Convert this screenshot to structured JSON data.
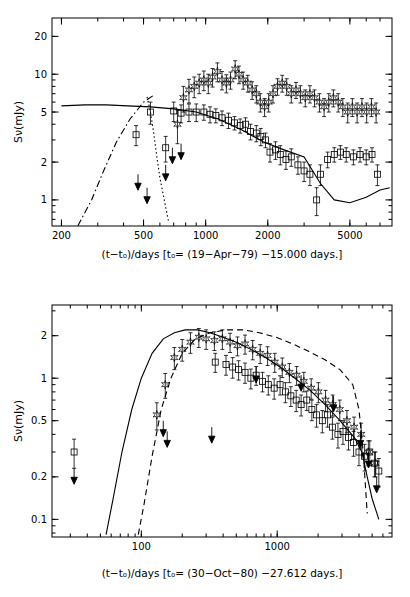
{
  "figure": {
    "title": "",
    "panels": [
      {
        "id": "top",
        "ylabel": "Sν(mJy)",
        "caption": "(t−t₀)/days [t₀= (19−Apr−79) −15.000 days.]",
        "x_ticklabels": [
          "200",
          "500",
          "1000",
          "2000",
          "5000"
        ],
        "x_tickvalues": [
          200,
          500,
          1000,
          2000,
          5000
        ],
        "y_ticklabels": [
          "1",
          "2",
          "5",
          "10",
          "20"
        ],
        "y_tickvalues": [
          1,
          2,
          5,
          10,
          20
        ],
        "xlim": [
          180,
          8000
        ],
        "ylim": [
          0.62,
          28
        ]
      },
      {
        "id": "bottom",
        "ylabel": "Sν(mJy)",
        "caption": "(t−t₀)/days [t₀= (30−Oct−80) −27.612 days.]",
        "x_ticklabels": [
          "100",
          "1000"
        ],
        "x_tickvalues": [
          100,
          1000
        ],
        "y_ticklabels": [
          "0.1",
          "0.2",
          "0.5",
          "1",
          "2"
        ],
        "y_tickvalues": [
          0.1,
          0.2,
          0.5,
          1,
          2
        ],
        "xlim": [
          22,
          7000
        ],
        "ylim": [
          0.075,
          3.3
        ]
      }
    ]
  },
  "chart_data": [
    {
      "type": "scatter",
      "title": "",
      "panel": "top",
      "xlabel": "(t-t0)/days [t0= (19-Apr-79) -15.000 days.]",
      "ylabel": "S_nu (mJy)",
      "xscale": "log",
      "yscale": "log",
      "xlim": [
        180,
        8000
      ],
      "ylim": [
        0.62,
        28
      ],
      "xticks": [
        200,
        500,
        1000,
        2000,
        5000
      ],
      "yticks": [
        1,
        2,
        5,
        10,
        20
      ],
      "grid": false,
      "legend": false,
      "series": [
        {
          "name": "squares (lower frequency flux)",
          "marker": "open-square",
          "x": [
            460,
            540,
            640,
            700,
            760,
            830,
            900,
            980,
            1050,
            1120,
            1200,
            1290,
            1380,
            1470,
            1560,
            1650,
            1760,
            1850,
            1950,
            2050,
            2180,
            2300,
            2450,
            2600,
            2800,
            3000,
            3200,
            3450,
            3600,
            3900,
            4200,
            4500,
            4800,
            5200,
            5600,
            6000,
            6400,
            6800
          ],
          "y": [
            3.3,
            5.0,
            2.6,
            5.1,
            4.9,
            5.0,
            5.0,
            5.0,
            4.8,
            4.7,
            4.5,
            4.3,
            4.1,
            3.9,
            4.0,
            3.5,
            3.4,
            3.2,
            3.0,
            2.4,
            2.5,
            2.3,
            2.1,
            2.2,
            1.9,
            1.7,
            1.6,
            1.0,
            1.6,
            2.1,
            2.3,
            2.4,
            2.3,
            2.2,
            2.3,
            2.2,
            2.3,
            1.6
          ],
          "yerr": [
            0.6,
            1.0,
            0.6,
            0.9,
            0.8,
            0.8,
            0.8,
            0.7,
            0.7,
            0.6,
            0.6,
            0.6,
            0.5,
            0.5,
            0.5,
            0.5,
            0.5,
            0.5,
            0.4,
            0.4,
            0.4,
            0.4,
            0.35,
            0.35,
            0.3,
            0.3,
            0.3,
            0.25,
            0.3,
            0.3,
            0.3,
            0.3,
            0.3,
            0.3,
            0.3,
            0.3,
            0.3,
            0.3
          ]
        },
        {
          "name": "stars (higher frequency flux)",
          "marker": "open-star",
          "x": [
            730,
            780,
            830,
            880,
            930,
            980,
            1030,
            1080,
            1140,
            1200,
            1260,
            1320,
            1390,
            1450,
            1520,
            1600,
            1680,
            1760,
            1840,
            1930,
            2020,
            2120,
            2230,
            2350,
            2470,
            2600,
            2740,
            2880,
            3040,
            3200,
            3370,
            3560,
            3750,
            3950,
            4160,
            4390,
            4620,
            4880,
            5140,
            5420,
            5720,
            6030,
            6360,
            6700
          ],
          "y": [
            4.0,
            6.5,
            7.5,
            8.0,
            8.5,
            9.0,
            8.5,
            9.5,
            10.5,
            9.0,
            8.5,
            9.0,
            11.0,
            10.0,
            9.0,
            8.5,
            7.5,
            7.0,
            6.0,
            5.5,
            6.0,
            7.0,
            8.0,
            8.5,
            8.0,
            7.0,
            7.5,
            7.0,
            6.5,
            7.0,
            6.5,
            6.0,
            5.5,
            6.0,
            6.5,
            6.0,
            5.5,
            5.0,
            5.5,
            5.0,
            5.5,
            5.0,
            5.5,
            5.0
          ],
          "yerr": [
            1.2,
            1.5,
            1.6,
            1.5,
            1.5,
            1.6,
            1.5,
            1.6,
            1.8,
            1.5,
            1.4,
            1.4,
            1.8,
            1.6,
            1.4,
            1.3,
            1.2,
            1.1,
            1.0,
            0.9,
            1.0,
            1.1,
            1.2,
            1.3,
            1.2,
            1.1,
            1.1,
            1.1,
            1.0,
            1.1,
            1.0,
            1.0,
            0.9,
            1.0,
            1.0,
            1.0,
            0.9,
            0.9,
            0.9,
            0.9,
            0.9,
            0.9,
            0.9,
            0.9
          ]
        },
        {
          "name": "upper limits (arrows)",
          "marker": "downward-arrow",
          "x": [
            470,
            520,
            640,
            690,
            760
          ],
          "y": [
            1.6,
            1.25,
            1.9,
            2.6,
            2.8
          ]
        }
      ],
      "model_curves": [
        {
          "name": "solid model",
          "style": "solid",
          "x": [
            200,
            260,
            330,
            420,
            540,
            700,
            900,
            1150,
            1500,
            1900,
            2400,
            3000,
            3600,
            4200,
            5000,
            6000,
            7000,
            7800
          ],
          "y": [
            5.6,
            5.7,
            5.7,
            5.6,
            5.5,
            5.3,
            5.0,
            4.4,
            3.6,
            2.9,
            2.5,
            2.2,
            1.35,
            1.0,
            0.95,
            1.05,
            1.2,
            1.25
          ]
        },
        {
          "name": "dash-dot model",
          "style": "dashdot",
          "x": [
            240,
            280,
            320,
            370,
            430,
            500,
            560
          ],
          "y": [
            0.62,
            1.0,
            1.7,
            2.9,
            4.4,
            6.0,
            6.8
          ]
        },
        {
          "name": "dotted model",
          "style": "dotted",
          "x": [
            520,
            540,
            560,
            580,
            600,
            630,
            660
          ],
          "y": [
            6.6,
            5.0,
            3.4,
            2.2,
            1.5,
            1.0,
            0.68
          ]
        }
      ]
    },
    {
      "type": "scatter",
      "title": "",
      "panel": "bottom",
      "xlabel": "(t-t0)/days [t0= (30-Oct-80) -27.612 days.]",
      "ylabel": "S_nu (mJy)",
      "xscale": "log",
      "yscale": "log",
      "xlim": [
        22,
        7000
      ],
      "ylim": [
        0.075,
        3.3
      ],
      "xticks": [
        100,
        1000
      ],
      "yticks": [
        0.1,
        0.2,
        0.5,
        1,
        2
      ],
      "grid": false,
      "legend": false,
      "series": [
        {
          "name": "squares (lower frequency flux)",
          "marker": "open-square",
          "x": [
            32,
            350,
            420,
            470,
            520,
            580,
            640,
            700,
            780,
            860,
            950,
            1050,
            1150,
            1260,
            1380,
            1500,
            1650,
            1800,
            1950,
            2150,
            2350,
            2550,
            2800,
            3050,
            3350,
            3650,
            4000,
            4400,
            4800,
            5200,
            5600
          ],
          "y": [
            0.3,
            1.3,
            1.25,
            1.2,
            1.15,
            1.1,
            1.0,
            1.05,
            0.95,
            0.9,
            0.85,
            0.9,
            0.8,
            0.75,
            0.7,
            0.65,
            0.7,
            0.6,
            0.55,
            0.5,
            0.55,
            0.45,
            0.4,
            0.42,
            0.38,
            0.35,
            0.3,
            0.28,
            0.3,
            0.25,
            0.22
          ],
          "yerr": [
            0.07,
            0.2,
            0.2,
            0.2,
            0.18,
            0.18,
            0.16,
            0.16,
            0.15,
            0.14,
            0.14,
            0.14,
            0.13,
            0.12,
            0.12,
            0.11,
            0.11,
            0.1,
            0.1,
            0.09,
            0.1,
            0.08,
            0.08,
            0.08,
            0.07,
            0.07,
            0.06,
            0.06,
            0.06,
            0.05,
            0.05
          ]
        },
        {
          "name": "stars (higher frequency flux)",
          "marker": "open-star",
          "x": [
            130,
            150,
            175,
            200,
            230,
            265,
            300,
            345,
            395,
            450,
            510,
            580,
            660,
            750,
            850,
            960,
            1090,
            1230,
            1390,
            1570,
            1780,
            2010,
            2270,
            2560,
            2890,
            3260,
            3680,
            4150,
            4690,
            5290
          ],
          "y": [
            0.55,
            0.9,
            1.4,
            1.6,
            1.8,
            1.95,
            1.9,
            1.85,
            1.9,
            1.8,
            1.7,
            1.75,
            1.6,
            1.5,
            1.45,
            1.3,
            1.2,
            1.1,
            1.05,
            0.95,
            0.85,
            0.8,
            0.7,
            0.65,
            0.6,
            0.5,
            0.45,
            0.4,
            0.3,
            0.25
          ],
          "yerr": [
            0.12,
            0.18,
            0.25,
            0.28,
            0.3,
            0.3,
            0.3,
            0.28,
            0.3,
            0.28,
            0.26,
            0.27,
            0.25,
            0.23,
            0.22,
            0.2,
            0.19,
            0.17,
            0.16,
            0.15,
            0.14,
            0.13,
            0.12,
            0.11,
            0.1,
            0.09,
            0.08,
            0.08,
            0.06,
            0.05
          ]
        },
        {
          "name": "upper limits (arrows)",
          "marker": "downward-arrow",
          "x": [
            32,
            145,
            155,
            330,
            700,
            1500,
            2600,
            4100,
            4700,
            5400
          ],
          "y": [
            0.23,
            0.5,
            0.42,
            0.45,
            1.2,
            1.05,
            0.75,
            0.42,
            0.3,
            0.2
          ]
        }
      ],
      "model_curves": [
        {
          "name": "solid model",
          "style": "solid",
          "x": [
            55,
            62,
            72,
            85,
            100,
            120,
            145,
            175,
            210,
            260,
            320,
            400,
            500,
            640,
            820,
            1050,
            1350,
            1750,
            2250,
            2900,
            3700,
            4200,
            4600,
            5000,
            5600
          ],
          "y": [
            0.078,
            0.14,
            0.3,
            0.6,
            1.0,
            1.5,
            1.9,
            2.1,
            2.2,
            2.2,
            2.1,
            1.95,
            1.8,
            1.6,
            1.4,
            1.2,
            1.0,
            0.82,
            0.65,
            0.5,
            0.38,
            0.3,
            0.2,
            0.14,
            0.1
          ]
        },
        {
          "name": "dashed model",
          "style": "dashed",
          "x": [
            95,
            105,
            120,
            140,
            165,
            200,
            250,
            320,
            420,
            560,
            740,
            980,
            1300,
            1700,
            2250,
            2900,
            3600,
            4000,
            4300,
            4600
          ],
          "y": [
            0.078,
            0.13,
            0.28,
            0.6,
            1.0,
            1.5,
            1.9,
            2.1,
            2.2,
            2.2,
            2.1,
            1.95,
            1.75,
            1.55,
            1.35,
            1.15,
            0.9,
            0.6,
            0.3,
            0.11
          ]
        }
      ]
    }
  ]
}
